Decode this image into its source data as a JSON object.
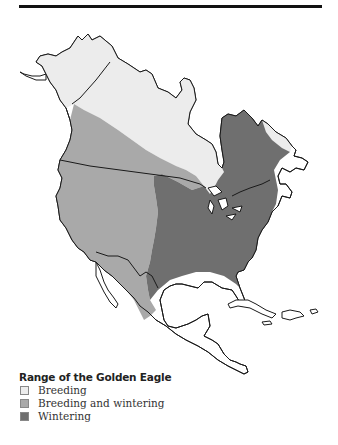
{
  "figure": {
    "title": "Range of the Golden Eagle",
    "colors": {
      "breeding": "#ececec",
      "breeding_and_wintering": "#a9a9a9",
      "wintering": "#6f6f6f",
      "outline": "#1a1a1a",
      "rule": "#111111"
    }
  },
  "legend": {
    "title": "Range of the Golden Eagle",
    "items": [
      {
        "label": "Breeding",
        "color": "#ececec"
      },
      {
        "label": "Breeding and wintering",
        "color": "#a9a9a9"
      },
      {
        "label": "Wintering",
        "color": "#6f6f6f"
      }
    ]
  },
  "map": {
    "region": "North America",
    "regions": [
      "Alaska",
      "Canada",
      "United States",
      "Mexico",
      "Central America",
      "Caribbean"
    ]
  }
}
